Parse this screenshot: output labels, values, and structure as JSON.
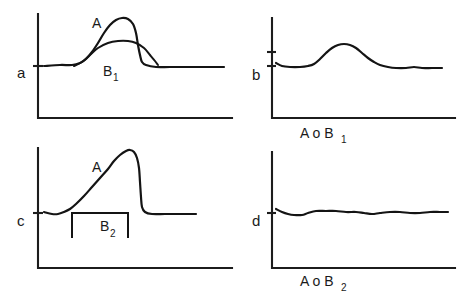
{
  "figure": {
    "ink_color": "#141414",
    "background_color": "#ffffff",
    "panels": [
      {
        "id": "a",
        "letter": "a",
        "caption": "",
        "labels": [
          {
            "base": "A",
            "sub": ""
          },
          {
            "base": "B",
            "sub": "1"
          }
        ]
      },
      {
        "id": "b",
        "letter": "b",
        "caption_base": "A o B",
        "caption_sub": "1",
        "labels": []
      },
      {
        "id": "c",
        "letter": "c",
        "caption": "",
        "labels": [
          {
            "base": "A",
            "sub": ""
          },
          {
            "base": "B",
            "sub": "2"
          }
        ]
      },
      {
        "id": "d",
        "letter": "d",
        "caption_base": "A o B",
        "caption_sub": "2",
        "labels": []
      }
    ]
  },
  "chart_data": {
    "type": "line",
    "title": "",
    "xlabel": "",
    "ylabel": "",
    "grid": false,
    "legend": "none",
    "panels": [
      {
        "id": "a",
        "letter": "a",
        "caption": "",
        "axes": {
          "x_origin": 38,
          "x_end": 232,
          "y_top": 14,
          "y_bottom": 118,
          "baseline": 66
        },
        "series": [
          {
            "name": "A",
            "label": "A",
            "label_sub": "",
            "label_x": 92,
            "label_y": 28,
            "type": "sharp-peak",
            "points": [
              [
                44,
                66
              ],
              [
                60,
                65
              ],
              [
                72,
                65
              ],
              [
                80,
                63
              ],
              [
                86,
                59
              ],
              [
                92,
                52
              ],
              [
                98,
                43
              ],
              [
                104,
                33
              ],
              [
                110,
                25
              ],
              [
                116,
                20
              ],
              [
                122,
                18
              ],
              [
                128,
                19
              ],
              [
                133,
                24
              ],
              [
                136,
                33
              ],
              [
                138,
                45
              ],
              [
                140,
                55
              ],
              [
                142,
                62
              ],
              [
                146,
                65
              ],
              [
                156,
                67
              ],
              [
                170,
                67
              ],
              [
                190,
                67
              ],
              [
                210,
                67
              ],
              [
                224,
                67
              ]
            ]
          },
          {
            "name": "B1",
            "label": "B",
            "label_sub": "1",
            "label_x": 103,
            "label_y": 76,
            "type": "broad-dome",
            "points": [
              [
                74,
                66
              ],
              [
                82,
                62
              ],
              [
                90,
                55
              ],
              [
                98,
                48
              ],
              [
                108,
                43
              ],
              [
                118,
                41
              ],
              [
                128,
                41
              ],
              [
                136,
                43
              ],
              [
                144,
                48
              ],
              [
                150,
                55
              ],
              [
                155,
                61
              ],
              [
                158,
                65
              ]
            ]
          }
        ]
      },
      {
        "id": "b",
        "letter": "b",
        "caption": "A o B1",
        "caption_base": "A o B",
        "caption_sub": "1",
        "caption_x": 300,
        "caption_y": 138,
        "axes": {
          "x_origin": 272,
          "x_end": 455,
          "y_top": 18,
          "y_bottom": 118,
          "baseline": 66
        },
        "series": [
          {
            "name": "A o B1",
            "type": "smooth-bump",
            "points": [
              [
                276,
                63
              ],
              [
                282,
                66
              ],
              [
                290,
                67
              ],
              [
                300,
                67
              ],
              [
                308,
                66
              ],
              [
                314,
                64
              ],
              [
                320,
                59
              ],
              [
                326,
                53
              ],
              [
                332,
                48
              ],
              [
                338,
                45
              ],
              [
                344,
                44
              ],
              [
                350,
                45
              ],
              [
                356,
                48
              ],
              [
                362,
                53
              ],
              [
                368,
                58
              ],
              [
                374,
                62
              ],
              [
                380,
                65
              ],
              [
                388,
                67
              ],
              [
                396,
                68
              ],
              [
                406,
                68
              ],
              [
                414,
                67
              ],
              [
                422,
                68
              ],
              [
                432,
                68
              ],
              [
                442,
                68
              ]
            ]
          }
        ]
      },
      {
        "id": "c",
        "letter": "c",
        "caption": "",
        "axes": {
          "x_origin": 38,
          "x_end": 232,
          "y_top": 148,
          "y_bottom": 268,
          "baseline": 213
        },
        "series": [
          {
            "name": "A",
            "label": "A",
            "label_sub": "",
            "label_x": 92,
            "label_y": 172,
            "type": "asymmetric-peak",
            "points": [
              [
                44,
                212
              ],
              [
                52,
                214
              ],
              [
                58,
                214
              ],
              [
                64,
                212
              ],
              [
                70,
                209
              ],
              [
                76,
                204
              ],
              [
                84,
                196
              ],
              [
                92,
                187
              ],
              [
                100,
                178
              ],
              [
                108,
                169
              ],
              [
                114,
                161
              ],
              [
                120,
                155
              ],
              [
                126,
                151
              ],
              [
                130,
                150
              ],
              [
                134,
                152
              ],
              [
                137,
                158
              ],
              [
                139,
                168
              ],
              [
                140,
                182
              ],
              [
                141,
                197
              ],
              [
                142,
                207
              ],
              [
                145,
                212
              ],
              [
                152,
                214
              ],
              [
                165,
                214
              ],
              [
                180,
                214
              ],
              [
                196,
                214
              ]
            ]
          },
          {
            "name": "B2",
            "label": "B",
            "label_sub": "2",
            "label_x": 100,
            "label_y": 231,
            "type": "rectangular-window",
            "window_left": 72,
            "window_right": 128,
            "window_top": 213,
            "window_bottom": 238,
            "points": [
              [
                72,
                238
              ],
              [
                72,
                213
              ],
              [
                128,
                213
              ],
              [
                128,
                238
              ]
            ]
          }
        ]
      },
      {
        "id": "d",
        "letter": "d",
        "caption": "A o B2",
        "caption_base": "A o B",
        "caption_sub": "2",
        "caption_x": 300,
        "caption_y": 286,
        "axes": {
          "x_origin": 272,
          "x_end": 455,
          "y_top": 152,
          "y_bottom": 268,
          "baseline": 213
        },
        "series": [
          {
            "name": "A o B2",
            "type": "near-flat",
            "points": [
              [
                276,
                209
              ],
              [
                282,
                212
              ],
              [
                288,
                214
              ],
              [
                294,
                215
              ],
              [
                302,
                215
              ],
              [
                308,
                213
              ],
              [
                316,
                211
              ],
              [
                326,
                211
              ],
              [
                336,
                211
              ],
              [
                346,
                212
              ],
              [
                356,
                212
              ],
              [
                364,
                213
              ],
              [
                372,
                214
              ],
              [
                380,
                213
              ],
              [
                390,
                212
              ],
              [
                400,
                212
              ],
              [
                410,
                213
              ],
              [
                420,
                213
              ],
              [
                430,
                212
              ],
              [
                440,
                212
              ],
              [
                448,
                212
              ]
            ]
          }
        ]
      }
    ]
  }
}
